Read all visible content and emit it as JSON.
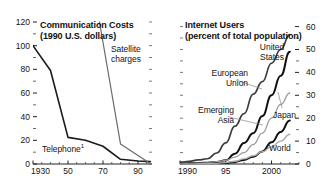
{
  "figure": {
    "background": "#ffffff",
    "width": 332,
    "height": 193
  },
  "chart_data": [
    {
      "type": "line",
      "panel": "left",
      "title": "Communication Costs",
      "subtitle": "(1990 U.S. dollars)",
      "xlabel": "",
      "ylabel": "",
      "xlim": [
        1930,
        1998
      ],
      "ylim": [
        0,
        120
      ],
      "yticks": [
        0,
        20,
        40,
        60,
        80,
        100,
        120
      ],
      "ytick_labels": [
        "0",
        "20",
        "40",
        "60",
        "80",
        "100",
        "120"
      ],
      "yminor_step": 10,
      "xticks": [
        1930,
        1950,
        1970,
        1990
      ],
      "xtick_labels": [
        "1930",
        "50",
        "70",
        "90"
      ],
      "xminor_step": 5,
      "grid": false,
      "legend": "inline-annotations",
      "series": [
        {
          "name": "Telephone",
          "label": "Telephone",
          "label_superscript": "1",
          "color": "#1a1a1a",
          "width": 1.6,
          "x": [
            1930,
            1940,
            1950,
            1960,
            1970,
            1980,
            1990,
            1997
          ],
          "values": [
            100,
            79,
            22.5,
            20,
            15,
            4,
            2.5,
            2
          ]
        },
        {
          "name": "Satellite charges",
          "label": "Satellite charges",
          "color": "#6b6b6b",
          "width": 1.2,
          "x": [
            1968,
            1980,
            1997
          ],
          "values": [
            120,
            17,
            0.5
          ]
        }
      ]
    },
    {
      "type": "line",
      "panel": "right",
      "title": "Internet Users",
      "subtitle": "(percent of total population)",
      "xlabel": "",
      "ylabel": "",
      "xlim": [
        1990,
        2003
      ],
      "ylim": [
        0,
        62
      ],
      "yticks": [
        0,
        10,
        20,
        30,
        40,
        50,
        60
      ],
      "ytick_labels": [
        "0",
        "10",
        "20",
        "30",
        "40",
        "50",
        "60"
      ],
      "yminor_step": 5,
      "xticks": [
        1990,
        1995,
        2000
      ],
      "xtick_labels": [
        "1990",
        "95",
        "2000"
      ],
      "xminor_step": 1,
      "grid": false,
      "legend": "inline-annotations",
      "series": [
        {
          "name": "United States",
          "label": "United States",
          "color": "#3c3c3c",
          "width": 1.7,
          "x": [
            1990,
            1991,
            1992,
            1993,
            1994,
            1995,
            1996,
            1997,
            1998,
            1999,
            2000,
            2001,
            2002
          ],
          "values": [
            0.8,
            1.2,
            1.8,
            2.3,
            4.8,
            9.2,
            16.5,
            22,
            30.5,
            36,
            44,
            50,
            56.5
          ]
        },
        {
          "name": "Japan",
          "label": "Japan",
          "color": "#111111",
          "width": 2.0,
          "x": [
            1990,
            1991,
            1992,
            1993,
            1994,
            1995,
            1996,
            1997,
            1998,
            1999,
            2000,
            2001,
            2002
          ],
          "values": [
            0.2,
            0.3,
            0.4,
            0.6,
            0.9,
            1.6,
            4.5,
            9.2,
            13.4,
            21,
            30,
            38.5,
            49
          ]
        },
        {
          "name": "European Union",
          "label": "European Union",
          "color": "#9a9a9a",
          "width": 1.3,
          "x": [
            1990,
            1991,
            1992,
            1993,
            1994,
            1995,
            1996,
            1997,
            1998,
            1999,
            2000,
            2001,
            2002
          ],
          "values": [
            0.2,
            0.3,
            0.4,
            0.6,
            1.0,
            1.6,
            3.0,
            5.0,
            8.5,
            13.5,
            20,
            26,
            31
          ]
        },
        {
          "name": "Emerging Asia",
          "label": "Emerging Asia",
          "color": "#111111",
          "width": 2.0,
          "x": [
            1990,
            1991,
            1992,
            1993,
            1994,
            1995,
            1996,
            1997,
            1998,
            1999,
            2000,
            2001,
            2002
          ],
          "values": [
            0.05,
            0.06,
            0.08,
            0.1,
            0.2,
            0.4,
            0.9,
            1.8,
            3.2,
            5.5,
            9.5,
            14,
            19
          ]
        },
        {
          "name": "World",
          "label": "World",
          "color": "#aaaaaa",
          "width": 1.3,
          "x": [
            1990,
            1991,
            1992,
            1993,
            1994,
            1995,
            1996,
            1997,
            1998,
            1999,
            2000,
            2001,
            2002
          ],
          "values": [
            0.05,
            0.07,
            0.1,
            0.15,
            0.3,
            0.6,
            1.2,
            2.2,
            3.6,
            5.4,
            7.5,
            10,
            13
          ]
        }
      ]
    }
  ]
}
